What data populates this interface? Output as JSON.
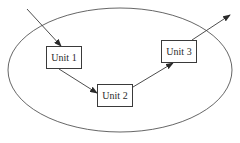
{
  "diagram": {
    "type": "process-flow",
    "boundary": {
      "shape": "ellipse",
      "cx": 120,
      "cy": 70,
      "rx": 112,
      "ry": 62,
      "stroke": "#555555"
    },
    "units": [
      {
        "id": "unit1",
        "label": "Unit 1",
        "x": 46,
        "y": 46,
        "w": 36,
        "h": 23
      },
      {
        "id": "unit2",
        "label": "Unit 2",
        "x": 97,
        "y": 84,
        "w": 36,
        "h": 23
      },
      {
        "id": "unit3",
        "label": "Unit 3",
        "x": 161,
        "y": 40,
        "w": 36,
        "h": 23
      }
    ],
    "arrows": [
      {
        "from": "outside",
        "to": "Unit 1",
        "x1": 27,
        "y1": 9,
        "x2": 61,
        "y2": 46
      },
      {
        "from": "Unit 1",
        "to": "Unit 2",
        "x1": 59,
        "y1": 69,
        "x2": 97,
        "y2": 93
      },
      {
        "from": "Unit 2",
        "to": "Unit 3",
        "x1": 133,
        "y1": 87,
        "x2": 173,
        "y2": 63
      },
      {
        "from": "Unit 3",
        "to": "outside",
        "x1": 192,
        "y1": 40,
        "x2": 230,
        "y2": 15
      }
    ],
    "colors": {
      "line": "#3a3a3a",
      "background": "#ffffff"
    }
  }
}
